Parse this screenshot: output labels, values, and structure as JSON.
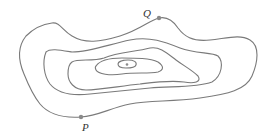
{
  "diagram": {
    "type": "contour-map",
    "contour_count": 5,
    "has_summit_point": true,
    "line_color": "#7a7a7a",
    "points": [
      {
        "label": "Q",
        "location": "on outer contour, top"
      },
      {
        "label": "P",
        "location": "on outer contour, bottom-left"
      }
    ]
  },
  "labels": {
    "q": "Q",
    "p": "P"
  }
}
